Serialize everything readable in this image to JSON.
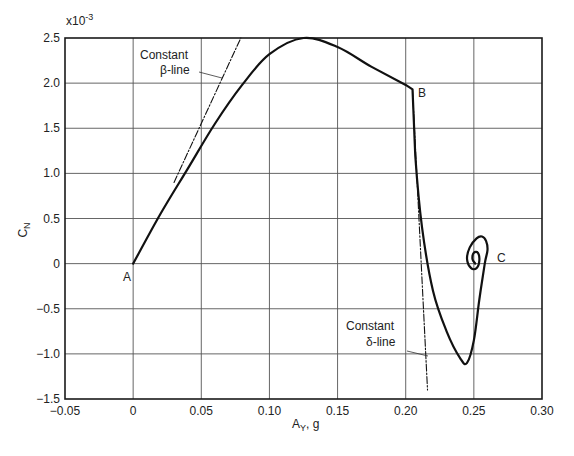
{
  "chart_data": {
    "type": "line",
    "title": "",
    "xlabel": "A_Y, g",
    "ylabel": "C_N",
    "y_scale_note": "x10^-3",
    "xlim": [
      -0.05,
      0.3
    ],
    "ylim": [
      -1.5,
      2.5
    ],
    "grid": true,
    "x_ticks": [
      "-0.05",
      "0",
      "0.05",
      "0.10",
      "0.15",
      "0.20",
      "0.25",
      "0.30"
    ],
    "y_ticks": [
      "-1.5",
      "-1.0",
      "-0.5",
      "0",
      "0.5",
      "1.0",
      "1.5",
      "2.0",
      "2.5"
    ],
    "series": [
      {
        "name": "Trajectory",
        "style": "solid",
        "x": [
          0.0,
          0.02,
          0.04,
          0.06,
          0.08,
          0.1,
          0.125,
          0.15,
          0.175,
          0.2,
          0.205,
          0.207,
          0.212,
          0.22,
          0.23,
          0.24,
          0.245,
          0.25,
          0.254,
          0.258,
          0.26,
          0.259,
          0.256,
          0.252,
          0.247,
          0.245,
          0.248,
          0.252,
          0.254,
          0.253,
          0.25,
          0.249,
          0.251
        ],
        "y": [
          0.0,
          0.55,
          1.05,
          1.55,
          1.98,
          2.32,
          2.5,
          2.4,
          2.18,
          1.98,
          1.93,
          1.2,
          0.4,
          -0.3,
          -0.75,
          -1.05,
          -1.1,
          -0.85,
          -0.4,
          0.0,
          0.15,
          0.25,
          0.3,
          0.28,
          0.18,
          0.05,
          -0.05,
          -0.05,
          0.03,
          0.12,
          0.12,
          0.05,
          0.0
        ]
      },
      {
        "name": "Constant β-line",
        "style": "dash-dot",
        "x": [
          0.03,
          0.079
        ],
        "y": [
          0.9,
          2.5
        ]
      },
      {
        "name": "Constant δ-line",
        "style": "dash-dot",
        "x": [
          0.205,
          0.216
        ],
        "y": [
          1.93,
          -1.4
        ]
      }
    ],
    "annotations": [
      {
        "text": "A",
        "x": 0.0,
        "y": 0.0
      },
      {
        "text": "B",
        "x": 0.205,
        "y": 1.95
      },
      {
        "text": "C",
        "x": 0.26,
        "y": 0.05
      },
      {
        "text": "Constant",
        "line2": "β-line",
        "points_to": "Constant β-line"
      },
      {
        "text": "Constant",
        "line2": "δ-line",
        "points_to": "Constant δ-line"
      }
    ]
  },
  "labels": {
    "y_scale": "x10",
    "y_scale_exp": "-3",
    "xlabel_main": "A",
    "xlabel_sub": "Y",
    "xlabel_rest": ", g",
    "ylabel_main": "C",
    "ylabel_sub": "N",
    "point_a": "A",
    "point_b": "B",
    "point_c": "C",
    "beta_line1": "Constant",
    "beta_line2": "β-line",
    "delta_line1": "Constant",
    "delta_line2": "δ-line"
  }
}
